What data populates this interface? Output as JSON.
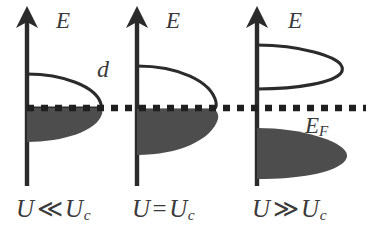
{
  "figure": {
    "background_color": "#ffffff",
    "ink_color": "#2b2b2b",
    "fill_color": "#4d4d4d",
    "text_color": "#3a3a3a",
    "fermi_line": {
      "label": "E_F",
      "label_text": "E",
      "label_sub": "F",
      "style": "dotted",
      "y": 108
    },
    "hybridization_label": "d",
    "axis_label": "E",
    "panels": [
      {
        "id": "panel-weak-coupling",
        "axis_label": "E",
        "caption_lhs": "U",
        "caption_rel": "≪",
        "caption_rhs": "U",
        "caption_sub": "c",
        "caption_full": "U ≪ U_c",
        "axis_x": 27,
        "upper_lobe": {
          "filled": false,
          "top": 74,
          "bottom": 108,
          "tip_x": 101
        },
        "lower_lobe": {
          "filled": true,
          "top": 108,
          "bottom": 142,
          "tip_x": 103
        }
      },
      {
        "id": "panel-critical",
        "axis_label": "E",
        "caption_lhs": "U",
        "caption_rel": "=",
        "caption_rhs": "U",
        "caption_sub": "c",
        "caption_full": "U = U_c",
        "axis_x": 137,
        "upper_lobe": {
          "filled": false,
          "top": 66,
          "bottom": 110,
          "tip_x": 216
        },
        "lower_lobe": {
          "filled": true,
          "top": 109,
          "bottom": 155,
          "tip_x": 218
        }
      },
      {
        "id": "panel-strong-coupling",
        "axis_label": "E",
        "caption_lhs": "U",
        "caption_rel": "≫",
        "caption_rhs": "U",
        "caption_sub": "c",
        "caption_full": "U ≫ U_c",
        "axis_x": 257,
        "upper_lobe": {
          "filled": false,
          "top": 45,
          "bottom": 89,
          "tip_x": 341
        },
        "lower_lobe": {
          "filled": true,
          "top": 128,
          "bottom": 179,
          "tip_x": 346
        }
      }
    ]
  }
}
